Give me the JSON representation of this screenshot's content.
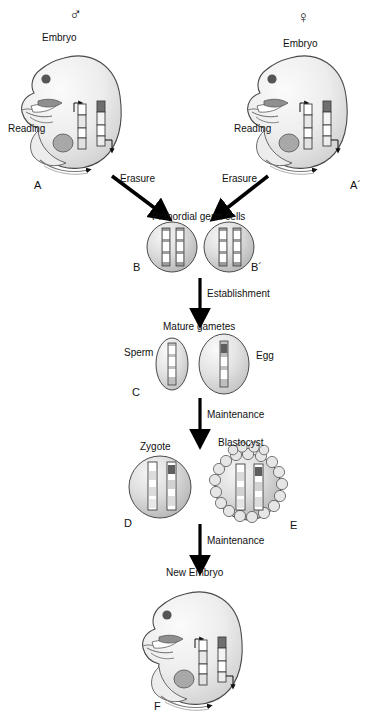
{
  "figure": {
    "type": "biological-process-diagram"
  },
  "colors": {
    "outline": "#3c3c3c",
    "body_fill_light": "#f2f2f2",
    "body_fill_mid": "#d9d9d9",
    "cell_fill": "#d0d0d0",
    "chromosome_dark": "#4d4d4d",
    "chromosome_mid": "#9e9e9e",
    "chromosome_light": "#ffffff",
    "arrow": "#000000",
    "text": "#111111"
  },
  "symbols": {
    "male": "♂",
    "female": "♀"
  },
  "stages": {
    "male_embryo": {
      "panel": "A",
      "sex_symbol": "♂",
      "title": "Embryo",
      "process_label": "Reading"
    },
    "female_embryo": {
      "panel": "A´",
      "sex_symbol": "♀",
      "title": "Embryo",
      "process_label": "Reading"
    },
    "pgc_male": {
      "panel": "B",
      "title": "Primordial germ cells"
    },
    "pgc_female": {
      "panel": "B´",
      "title": "Primordial germ cells"
    },
    "gametes": {
      "panel": "C",
      "title": "Mature gametes",
      "sperm_label": "Sperm",
      "egg_label": "Egg"
    },
    "zygote": {
      "panel": "D",
      "title": "Zygote"
    },
    "blastocyst": {
      "panel": "E",
      "title": "Blastocyst"
    },
    "new_embryo": {
      "panel": "F",
      "title": "New Embryo"
    }
  },
  "transitions": {
    "erasure_male": "Erasure",
    "erasure_female": "Erasure",
    "establishment": "Establishment",
    "maintenance_1": "Maintenance",
    "maintenance_2": "Maintenance"
  }
}
